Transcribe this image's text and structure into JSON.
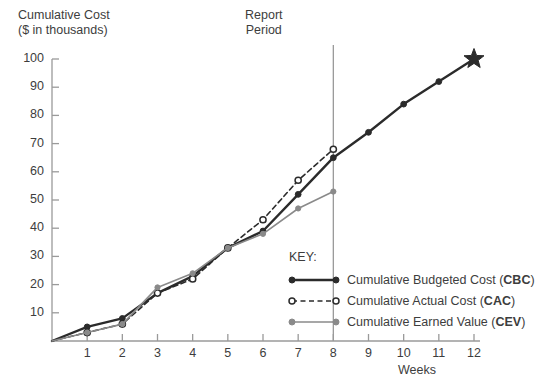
{
  "chart_data": {
    "type": "line",
    "title": "",
    "ylabel_line1": "Cumulative Cost",
    "ylabel_line2": "($ in thousands)",
    "xlabel": "Weeks",
    "x": [
      0,
      1,
      2,
      3,
      4,
      5,
      6,
      7,
      8,
      9,
      10,
      11,
      12
    ],
    "xticks": [
      "1",
      "2",
      "3",
      "4",
      "5",
      "6",
      "7",
      "8",
      "9",
      "10",
      "11",
      "12"
    ],
    "yticks": [
      "10",
      "20",
      "30",
      "40",
      "50",
      "60",
      "70",
      "80",
      "90",
      "100"
    ],
    "xlim": [
      0,
      12
    ],
    "ylim": [
      0,
      100
    ],
    "grid": false,
    "legend_position": "inside-lower-right",
    "series": [
      {
        "name": "Cumulative Budgeted Cost (CBC)",
        "abbr": "CBC",
        "label_plain": "Cumulative Budgeted Cost (",
        "label_close": ")",
        "color": "#2b2b2b",
        "style": "solid",
        "marker": "filled-circle",
        "x": [
          0,
          1,
          2,
          3,
          4,
          5,
          6,
          7,
          8,
          9,
          10,
          11,
          12
        ],
        "values": [
          0,
          5,
          8,
          17,
          23,
          33,
          39,
          52,
          65,
          74,
          84,
          92,
          100
        ]
      },
      {
        "name": "Cumulative Actual Cost (CAC)",
        "abbr": "CAC",
        "label_plain": "Cumulative Actual Cost (",
        "label_close": ")",
        "color": "#2b2b2b",
        "style": "dashed",
        "marker": "open-circle",
        "x": [
          0,
          1,
          2,
          3,
          4,
          5,
          6,
          7,
          8
        ],
        "values": [
          0,
          3,
          6,
          17,
          22,
          33,
          43,
          57,
          68
        ]
      },
      {
        "name": "Cumulative Earned Value (CEV)",
        "abbr": "CEV",
        "label_plain": "Cumulative Earned Value (",
        "label_close": ")",
        "color": "#8a8a8a",
        "style": "solid",
        "marker": "filled-circle",
        "x": [
          0,
          1,
          2,
          3,
          4,
          5,
          6,
          7,
          8
        ],
        "values": [
          0,
          3,
          6,
          19,
          24,
          33,
          38,
          47,
          53
        ]
      }
    ],
    "annotations": [
      {
        "name": "report-period",
        "label_line1": "Report",
        "label_line2": "Period",
        "type": "vline",
        "x": 8,
        "color": "#9a9a9a"
      },
      {
        "name": "target-star",
        "type": "star-marker",
        "x": 12,
        "y": 100,
        "color": "#2b2b2b"
      }
    ]
  },
  "legend": {
    "title": "KEY:"
  },
  "colors": {
    "dark": "#2b2b2b",
    "grey": "#8a8a8a",
    "axis": "#9a9a9a",
    "text": "#3d3d3d"
  }
}
